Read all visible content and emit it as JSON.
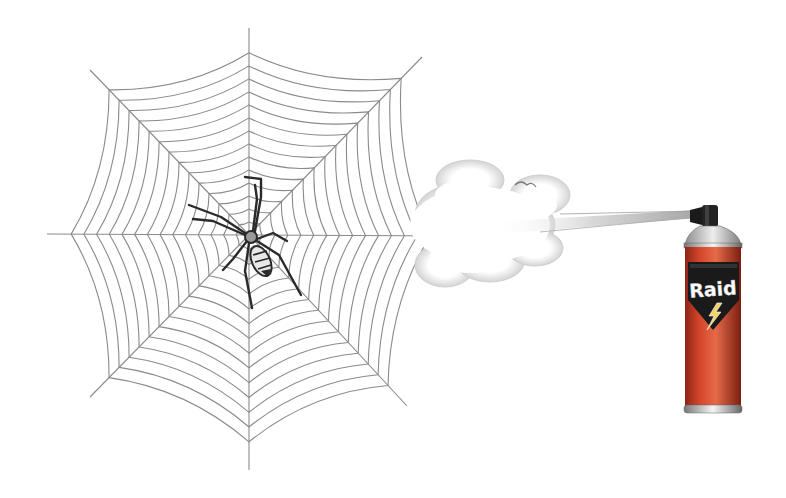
{
  "scene": {
    "description": "Illustration of a spider on a web being targeted by an insecticide spray can",
    "background": "#ffffff"
  },
  "web": {
    "center": [
      249,
      235
    ],
    "spoke_ends": [
      [
        249,
        28
      ],
      [
        422,
        57
      ],
      [
        455,
        236
      ],
      [
        407,
        406
      ],
      [
        249,
        470
      ],
      [
        90,
        397
      ],
      [
        47,
        234
      ],
      [
        90,
        70
      ]
    ],
    "ring_count": 14,
    "stroke_color": "#8a8a8a"
  },
  "spider": {
    "body_color": "#2a2a2a",
    "cephalothorax_color": "#9a9a9a",
    "position": [
      251,
      237
    ]
  },
  "spray": {
    "cloud_color": "#e6e6e6",
    "stream_color": "#bdbdbd"
  },
  "can": {
    "brand": "Raid",
    "body_color": "#d2452a",
    "shield_color": "#1a1a1a",
    "bolt_color": "#f3d26b",
    "cap_color": "#222222",
    "shoulder_color": "#c9c9c9"
  }
}
